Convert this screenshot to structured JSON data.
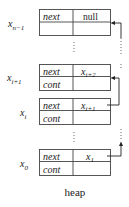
{
  "diagram": {
    "caption": "heap",
    "field_labels": {
      "next": "next",
      "cont": "cont"
    },
    "cells": [
      {
        "name": "x",
        "sub": "n−1",
        "next_value": "null",
        "next_sub": "",
        "cont_value": ""
      },
      {
        "name": "x",
        "sub": "i+1",
        "next_value": "x",
        "next_sub": "i+2",
        "cont_value": ""
      },
      {
        "name": "x",
        "sub": "i",
        "next_value": "x",
        "next_sub": "i+1",
        "cont_value": ""
      },
      {
        "name": "x",
        "sub": "0",
        "next_value": "x",
        "next_sub": "1",
        "cont_value": ""
      }
    ],
    "ellipsis": "⋮"
  }
}
